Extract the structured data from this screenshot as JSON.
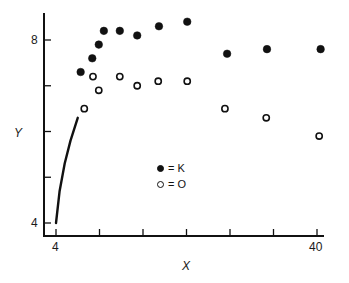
{
  "chart_data": {
    "type": "scatter",
    "title": "",
    "xlabel": "X",
    "ylabel": "Y",
    "xlim": [
      4,
      40
    ],
    "ylim": [
      4,
      8.6
    ],
    "x_tick_labels": [
      "4",
      "40"
    ],
    "y_tick_labels": [
      "4",
      "8"
    ],
    "x_ticks": [
      4,
      10,
      16,
      22,
      28,
      34,
      40
    ],
    "y_ticks": [
      4,
      5,
      6,
      7,
      8
    ],
    "grid": false,
    "legend_position": "center",
    "series": [
      {
        "name": "K",
        "marker": "filled-circle",
        "points": [
          [
            7.4,
            7.3
          ],
          [
            9.0,
            7.6
          ],
          [
            9.9,
            7.9
          ],
          [
            10.6,
            8.2
          ],
          [
            12.8,
            8.2
          ],
          [
            15.2,
            8.1
          ],
          [
            18.2,
            8.3
          ],
          [
            22.1,
            8.4
          ],
          [
            27.6,
            7.7
          ],
          [
            33.1,
            7.8
          ],
          [
            40.5,
            7.8
          ]
        ]
      },
      {
        "name": "O",
        "marker": "open-circle",
        "points": [
          [
            7.9,
            6.5
          ],
          [
            9.1,
            7.2
          ],
          [
            9.9,
            6.9
          ],
          [
            12.8,
            7.2
          ],
          [
            15.2,
            7.0
          ],
          [
            18.1,
            7.1
          ],
          [
            22.1,
            7.1
          ],
          [
            27.3,
            6.5
          ],
          [
            33.0,
            6.3
          ],
          [
            40.3,
            5.9
          ]
        ]
      },
      {
        "name": "curve",
        "marker": "line",
        "points": [
          [
            4.0,
            4.0
          ],
          [
            4.5,
            4.7
          ],
          [
            5.2,
            5.3
          ],
          [
            6.0,
            5.8
          ],
          [
            7.0,
            6.3
          ]
        ]
      }
    ],
    "legend": [
      {
        "symbol": "filled-circle",
        "label": "= K"
      },
      {
        "symbol": "open-circle",
        "label": "= O"
      }
    ]
  },
  "labels": {
    "x_min": "4",
    "x_max": "40",
    "y_min": "4",
    "y_max": "8",
    "x_title": "X",
    "y_title": "Y",
    "legend_k": "= K",
    "legend_o": "= O"
  }
}
